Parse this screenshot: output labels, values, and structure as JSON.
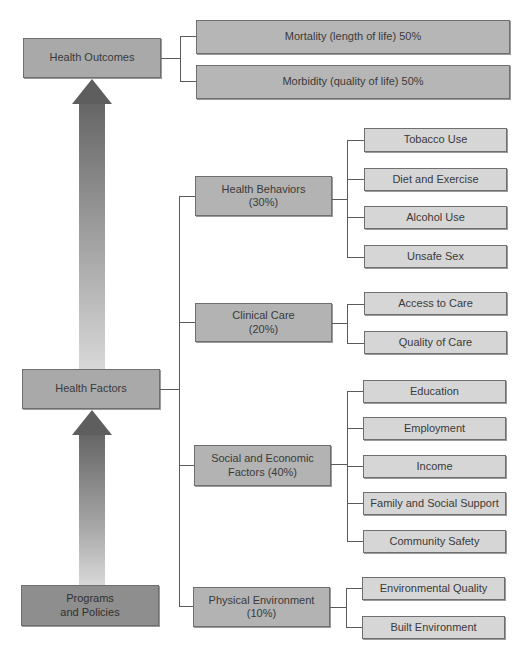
{
  "diagram": {
    "left_column": {
      "health_outcomes": "Health Outcomes",
      "health_factors": "Health Factors",
      "programs_and_policies": "Programs\nand Policies"
    },
    "outcomes": [
      {
        "label": "Mortality (length of life) 50%"
      },
      {
        "label": "Morbidity (quality of life) 50%"
      }
    ],
    "factors": [
      {
        "label": "Health Behaviors\n(30%)",
        "items": [
          {
            "label": "Tobacco Use"
          },
          {
            "label": "Diet and Exercise"
          },
          {
            "label": "Alcohol Use"
          },
          {
            "label": "Unsafe Sex"
          }
        ]
      },
      {
        "label": "Clinical Care\n(20%)",
        "items": [
          {
            "label": "Access to Care"
          },
          {
            "label": "Quality of Care"
          }
        ]
      },
      {
        "label": "Social and Economic\nFactors (40%)",
        "items": [
          {
            "label": "Education"
          },
          {
            "label": "Employment"
          },
          {
            "label": "Income"
          },
          {
            "label": "Family and Social Support"
          },
          {
            "label": "Community Safety"
          }
        ]
      },
      {
        "label": "Physical Environment\n(10%)",
        "items": [
          {
            "label": "Environmental Quality"
          },
          {
            "label": "Built Environment"
          }
        ]
      }
    ],
    "colors": {
      "main_box": "#a9a9a9",
      "programs_box": "#8e8e8e",
      "sub_box": "#d6d6d6",
      "connector": "#5a5a5a",
      "arrow_dark": "#5e5e5e",
      "arrow_light": "#d4d4d4"
    }
  }
}
